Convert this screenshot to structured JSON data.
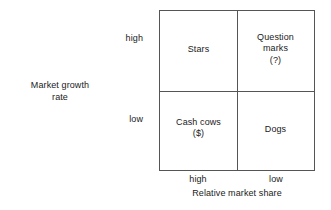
{
  "chart_data": {
    "type": "table",
    "title": "",
    "xlabel": "Relative market share",
    "ylabel": "Market growth rate",
    "x_ticks": [
      "high",
      "low"
    ],
    "y_ticks": [
      "high",
      "low"
    ],
    "grid": true,
    "legend": "none",
    "quadrants": [
      {
        "id": "top-left",
        "x": "high",
        "y": "high",
        "label": "Stars"
      },
      {
        "id": "top-right",
        "x": "low",
        "y": "high",
        "label": "Question\nmarks\n(?)"
      },
      {
        "id": "bottom-left",
        "x": "high",
        "y": "low",
        "label": "Cash cows\n($)"
      },
      {
        "id": "bottom-right",
        "x": "low",
        "y": "low",
        "label": "Dogs"
      }
    ],
    "line_color": "#555555",
    "text_color": "#1a1a1a",
    "background_color": "#ffffff"
  },
  "axes": {
    "y_title": "Market growth\nrate",
    "x_title": "Relative market share",
    "y_high": "high",
    "y_low": "low",
    "x_high": "high",
    "x_low": "low"
  },
  "quadrants": {
    "stars": "Stars",
    "question_marks": "Question\nmarks\n(?)",
    "cash_cows": "Cash cows\n($)",
    "dogs": "Dogs"
  }
}
